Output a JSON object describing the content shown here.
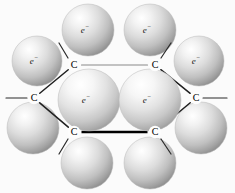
{
  "figure": {
    "background_color": "#fbfbfb",
    "sphere_highlight_color": "#ffffff",
    "sphere_mid_color": "#d8d8d8",
    "sphere_shadow_color": "#8f8f8f",
    "bond_dark_color": "#000000",
    "bond_light_color": "#8a8a8a",
    "label_color": "#1a1a1a"
  },
  "atoms": [
    {
      "id": "c-top-left",
      "label": "C",
      "x": 74,
      "y": 65
    },
    {
      "id": "c-top-right",
      "label": "C",
      "x": 155,
      "y": 65
    },
    {
      "id": "c-mid-left",
      "label": "C",
      "x": 34,
      "y": 98
    },
    {
      "id": "c-mid-right",
      "label": "C",
      "x": 196,
      "y": 98
    },
    {
      "id": "c-bottom-left",
      "label": "C",
      "x": 74,
      "y": 132
    },
    {
      "id": "c-bottom-right",
      "label": "C",
      "x": 155,
      "y": 132
    }
  ],
  "bonds": [
    {
      "id": "bond-top",
      "from": "c-top-left",
      "to": "c-top-right",
      "style": "thin"
    },
    {
      "id": "bond-upper-left",
      "from": "c-mid-left",
      "to": "c-top-left",
      "style": "mid"
    },
    {
      "id": "bond-upper-right",
      "from": "c-top-right",
      "to": "c-mid-right",
      "style": "mid"
    },
    {
      "id": "bond-lower-left",
      "from": "c-mid-left",
      "to": "c-bottom-left",
      "style": "mid"
    },
    {
      "id": "bond-lower-right",
      "from": "c-bottom-right",
      "to": "c-mid-right",
      "style": "mid"
    },
    {
      "id": "bond-bottom",
      "from": "c-bottom-left",
      "to": "c-bottom-right",
      "style": "thick"
    }
  ],
  "substituent_bonds": [
    {
      "id": "bond-stub-left",
      "x1": 6,
      "y1": 98,
      "x2": 27,
      "y2": 98
    },
    {
      "id": "bond-stub-right",
      "x1": 203,
      "y1": 98,
      "x2": 227,
      "y2": 98
    },
    {
      "id": "bond-stub-top-left",
      "x1": 68,
      "y1": 58,
      "x2": 59,
      "y2": 43
    },
    {
      "id": "bond-stub-top-right",
      "x1": 161,
      "y1": 58,
      "x2": 171,
      "y2": 43
    },
    {
      "id": "bond-stub-bottom-left",
      "x1": 68,
      "y1": 139,
      "x2": 59,
      "y2": 154
    },
    {
      "id": "bond-stub-bottom-right",
      "x1": 161,
      "y1": 139,
      "x2": 171,
      "y2": 154
    }
  ],
  "electron_clouds": [
    {
      "id": "cloud-top-left",
      "label": "e",
      "charge": "−",
      "cx": 88,
      "cy": 30,
      "r": 26,
      "labeled": true,
      "layer": "back"
    },
    {
      "id": "cloud-top-right",
      "label": "e",
      "charge": "−",
      "cx": 150,
      "cy": 30,
      "r": 26,
      "labeled": true,
      "layer": "back"
    },
    {
      "id": "cloud-left-upper",
      "label": "e",
      "charge": "−",
      "cx": 37,
      "cy": 61,
      "r": 25,
      "labeled": true,
      "layer": "back"
    },
    {
      "id": "cloud-right-upper",
      "label": "e",
      "charge": "−",
      "cx": 199,
      "cy": 61,
      "r": 25,
      "labeled": true,
      "layer": "back"
    },
    {
      "id": "cloud-left-lower",
      "label": "",
      "charge": "",
      "cx": 33,
      "cy": 128,
      "r": 26,
      "labeled": false,
      "layer": "back"
    },
    {
      "id": "cloud-right-lower",
      "label": "",
      "charge": "",
      "cx": 201,
      "cy": 128,
      "r": 26,
      "labeled": false,
      "layer": "back"
    },
    {
      "id": "cloud-bottom-left",
      "label": "",
      "charge": "",
      "cx": 87,
      "cy": 163,
      "r": 26,
      "labeled": false,
      "layer": "back"
    },
    {
      "id": "cloud-bottom-right",
      "label": "",
      "charge": "",
      "cx": 150,
      "cy": 163,
      "r": 26,
      "labeled": false,
      "layer": "back"
    },
    {
      "id": "cloud-center-left",
      "label": "e",
      "charge": "−",
      "cx": 89,
      "cy": 100,
      "r": 31,
      "labeled": true,
      "layer": "front"
    },
    {
      "id": "cloud-center-right",
      "label": "e",
      "charge": "−",
      "cx": 150,
      "cy": 100,
      "r": 31,
      "labeled": true,
      "layer": "front"
    }
  ]
}
